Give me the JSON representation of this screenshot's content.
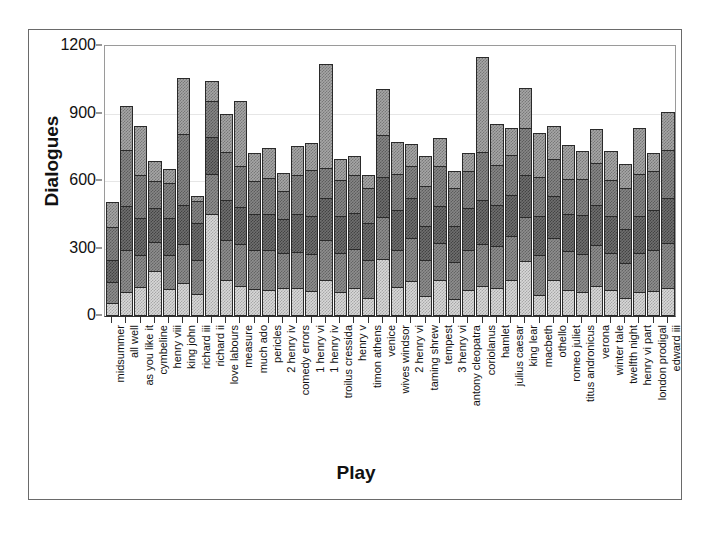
{
  "chart_data": {
    "type": "bar",
    "stacked": true,
    "title": "",
    "xlabel": "Play",
    "ylabel": "Dialogues",
    "ylim": [
      0,
      1200
    ],
    "yticks": [
      0,
      300,
      600,
      900,
      1200
    ],
    "grid": true,
    "legend_position": "none",
    "series": [
      {
        "name": "segment-1",
        "values": [
          60,
          105,
          130,
          200,
          120,
          145,
          100,
          455,
          160,
          135,
          120,
          115,
          125,
          125,
          110,
          160,
          105,
          125,
          80,
          255,
          130,
          155,
          90,
          160,
          75,
          115,
          135,
          125,
          160,
          245,
          95,
          160,
          115,
          105,
          135,
          115,
          80,
          105,
          110,
          125
        ]
      },
      {
        "name": "segment-2",
        "values": [
          90,
          190,
          140,
          130,
          150,
          175,
          150,
          175,
          180,
          185,
          175,
          180,
          155,
          160,
          165,
          180,
          175,
          175,
          170,
          185,
          165,
          190,
          160,
          165,
          165,
          180,
          185,
          185,
          195,
          195,
          175,
          185,
          175,
          170,
          180,
          165,
          155,
          175,
          185,
          200
        ]
      },
      {
        "name": "segment-3",
        "values": [
          100,
          195,
          165,
          150,
          165,
          175,
          165,
          165,
          175,
          165,
          160,
          160,
          150,
          170,
          170,
          185,
          165,
          160,
          165,
          180,
          175,
          180,
          150,
          165,
          160,
          185,
          195,
          185,
          185,
          185,
          175,
          190,
          165,
          175,
          180,
          165,
          150,
          165,
          175,
          200
        ]
      },
      {
        "name": "segment-4",
        "values": [
          145,
          250,
          190,
          120,
          155,
          315,
          95,
          160,
          215,
          180,
          145,
          160,
          125,
          170,
          205,
          135,
          160,
          165,
          155,
          185,
          160,
          140,
          180,
          175,
          170,
          165,
          215,
          175,
          175,
          210,
          175,
          165,
          155,
          160,
          185,
          160,
          185,
          185,
          175,
          215
        ]
      },
      {
        "name": "segment-5",
        "values": [
          110,
          195,
          220,
          90,
          65,
          250,
          25,
          90,
          170,
          290,
          125,
          130,
          80,
          130,
          120,
          460,
          95,
          85,
          55,
          205,
          145,
          100,
          130,
          125,
          75,
          80,
          420,
          185,
          120,
          180,
          195,
          145,
          150,
          125,
          150,
          130,
          105,
          205,
          80,
          165
        ]
      }
    ],
    "categories": [
      "midsummer",
      "all well",
      "as you like it",
      "cymbeline",
      "henry viii",
      "king john",
      "richard iii",
      "richard ii",
      "love labours",
      "measure",
      "much ado",
      "pericles",
      "2 henry iv",
      "comedy errors",
      "1 henry vi",
      "1 henry iv",
      "troilus cressida",
      "henry v",
      "timon athens",
      "venice",
      "wives windsor",
      "2 henry vi",
      "taming shrew",
      "tempest",
      "3 henry vi",
      "antony cleopatra",
      "coriolanus",
      "hamlet",
      "julius caesar",
      "king lear",
      "macbeth",
      "othello",
      "romeo juliet",
      "titus andronicus",
      "verona",
      "winter tale",
      "twelfth night",
      "henry vi part",
      "london prodigal",
      "edward iii"
    ],
    "totals": [
      505,
      935,
      845,
      690,
      655,
      1060,
      535,
      1045,
      900,
      955,
      725,
      745,
      635,
      755,
      770,
      1120,
      700,
      710,
      625,
      1010,
      775,
      765,
      710,
      790,
      645,
      725,
      1150,
      855,
      835,
      1015,
      815,
      845,
      760,
      735,
      830,
      735,
      675,
      835,
      725,
      905
    ]
  },
  "axis": {
    "y_title": "Dialogues",
    "x_title": "Play",
    "y_tick_labels": [
      "0",
      "300",
      "600",
      "900",
      "1200"
    ]
  }
}
